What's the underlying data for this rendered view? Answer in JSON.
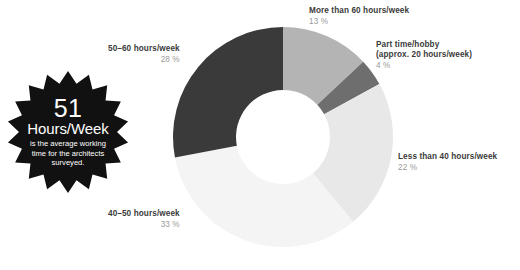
{
  "background_color": "#ffffff",
  "badge": {
    "number": "51",
    "unit": "Hours/Week",
    "description": "is the average working time for the architects surveyed.",
    "fill_color": "#111111",
    "text_color": "#ffffff",
    "points": 18
  },
  "chart_data": {
    "type": "pie",
    "variant": "donut",
    "title": "",
    "subtitle": "",
    "xlabel": "",
    "ylabel": "",
    "grid": false,
    "legend_position": "callout-labels",
    "value_unit": "%",
    "start_angle_deg": 0,
    "direction": "clockwise",
    "center": {
      "x": 283,
      "y": 137
    },
    "outer_radius": 110,
    "inner_radius": 47,
    "categories": [
      "More than 60 hours/week",
      "Part time/hobby (approx. 20 hours/week)",
      "Less than 40 hours/week",
      "40–50 hours/week",
      "50–60 hours/week"
    ],
    "values": [
      13,
      4,
      22,
      33,
      28
    ],
    "colors": [
      "#b4b4b4",
      "#6e6e6e",
      "#e8e8e8",
      "#f4f4f4",
      "#3a3a3a"
    ],
    "slices": [
      {
        "label": "More than 60 hours/week",
        "label_line_1": "More than 60 hours/week",
        "label_line_2": "",
        "value": 13,
        "value_text": "13 %",
        "color": "#b4b4b4"
      },
      {
        "label": "Part time/hobby (approx. 20 hours/week)",
        "label_line_1": "Part time/hobby",
        "label_line_2": "(approx. 20 hours/week)",
        "value": 4,
        "value_text": "4 %",
        "color": "#6e6e6e"
      },
      {
        "label": "Less than 40 hours/week",
        "label_line_1": "Less than 40 hours/week",
        "label_line_2": "",
        "value": 22,
        "value_text": "22 %",
        "color": "#e8e8e8"
      },
      {
        "label": "40–50 hours/week",
        "label_line_1": "40–50 hours/week",
        "label_line_2": "",
        "value": 33,
        "value_text": "33 %",
        "color": "#f4f4f4"
      },
      {
        "label": "50–60 hours/week",
        "label_line_1": "50–60 hours/week",
        "label_line_2": "",
        "value": 28,
        "value_text": "28 %",
        "color": "#3a3a3a"
      }
    ]
  }
}
